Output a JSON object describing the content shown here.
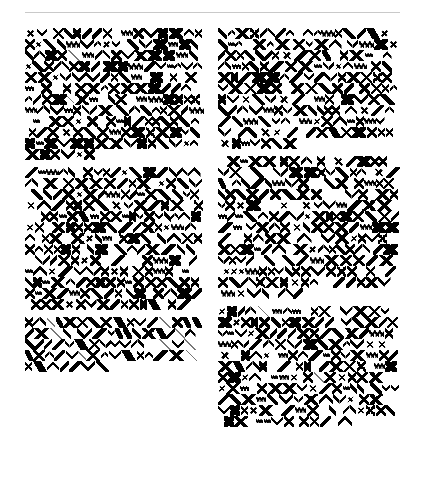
{
  "page": {
    "background_color": "#ffffff",
    "width": 421,
    "height": 489
  },
  "header": {
    "rule": {
      "name": "horizontal-rule",
      "color": "#c9c9c9",
      "x": 25,
      "y": 12,
      "width": 375,
      "thickness": 1
    }
  },
  "content": {
    "description": "Two-column page of dense obfuscated glyph text. No legible characters are rendered; every block is composed of diagonal strokes, X shapes, chevrons, zigzags and hollow diamonds.",
    "ink_color": "#000000",
    "faint_stroke_color": "#777777",
    "columns": [
      {
        "name": "column-left",
        "x": 25,
        "y": 28,
        "width": 180,
        "blocks": [
          {
            "name": "glyph-block-1",
            "lines": 12,
            "top": 28,
            "bottom": 168,
            "density": "high"
          },
          {
            "name": "glyph-block-2",
            "lines": 13,
            "top": 175,
            "bottom": 325,
            "density": "high"
          },
          {
            "name": "glyph-block-3",
            "lines": 5,
            "top": 332,
            "bottom": 410,
            "density": "medium"
          }
        ]
      },
      {
        "name": "column-right",
        "x": 218,
        "y": 28,
        "width": 182,
        "blocks": [
          {
            "name": "glyph-block-4",
            "lines": 11,
            "top": 28,
            "bottom": 160,
            "density": "high"
          },
          {
            "name": "glyph-block-5",
            "lines": 13,
            "top": 168,
            "bottom": 318,
            "density": "high"
          },
          {
            "name": "glyph-block-6",
            "lines": 11,
            "top": 327,
            "bottom": 455,
            "density": "high"
          }
        ]
      }
    ]
  },
  "glyph_alphabet": [
    {
      "key": "s-x",
      "label": "cross-glyph"
    },
    {
      "key": "s-f",
      "label": "forward-slash-glyph"
    },
    {
      "key": "s-b",
      "label": "back-slash-glyph"
    },
    {
      "key": "s-vv",
      "label": "chevron-down-glyph"
    },
    {
      "key": "s-aa",
      "label": "chevron-up-glyph"
    },
    {
      "key": "s-dia",
      "label": "diamond-glyph"
    },
    {
      "key": "s-hx",
      "label": "heavy-cross-glyph"
    },
    {
      "key": "s-thin",
      "label": "hairline-glyph"
    },
    {
      "key": "s-bar",
      "label": "heavy-bar-glyph"
    },
    {
      "key": "s-zz",
      "label": "zigzag-glyph"
    },
    {
      "key": "s-box",
      "label": "hollow-box-glyph"
    }
  ],
  "layout_seed": 20250117
}
